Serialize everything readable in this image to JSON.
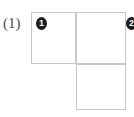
{
  "figure": {
    "label": "(1)",
    "border_color": "#c9c9c9",
    "marker_fill_color": "#1c1c1c",
    "marker_text_color": "#ffffff",
    "background_color": "#ffffff"
  },
  "grid": {
    "rows": 2,
    "cols": 2,
    "cells": [
      {
        "row": 0,
        "col": 0,
        "present": true,
        "marker": "1"
      },
      {
        "row": 0,
        "col": 1,
        "present": true,
        "marker": "2"
      },
      {
        "row": 1,
        "col": 0,
        "present": false,
        "marker": ""
      },
      {
        "row": 1,
        "col": 1,
        "present": true,
        "marker": ""
      }
    ]
  },
  "markers": [
    {
      "id": "marker-1",
      "label": "1"
    },
    {
      "id": "marker-2",
      "label": "2"
    }
  ]
}
